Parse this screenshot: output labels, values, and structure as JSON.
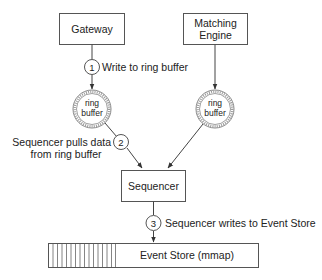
{
  "diagram": {
    "nodes": {
      "gateway": {
        "label": "Gateway"
      },
      "matching_engine": {
        "line1": "Matching",
        "line2": "Engine"
      },
      "ring_buffer_left": {
        "line1": "ring",
        "line2": "buffer"
      },
      "ring_buffer_right": {
        "line1": "ring",
        "line2": "buffer"
      },
      "sequencer": {
        "label": "Sequencer"
      },
      "event_store": {
        "label": "Event Store (mmap)"
      }
    },
    "steps": [
      {
        "number": "1",
        "text": "Write to ring buffer"
      },
      {
        "number": "2",
        "line1": "Sequencer pulls data",
        "line2": "from ring buffer"
      },
      {
        "number": "3",
        "text": "Sequencer writes to Event Store"
      }
    ],
    "colors": {
      "stroke": "#444444",
      "text": "#222222",
      "background": "#ffffff"
    }
  }
}
